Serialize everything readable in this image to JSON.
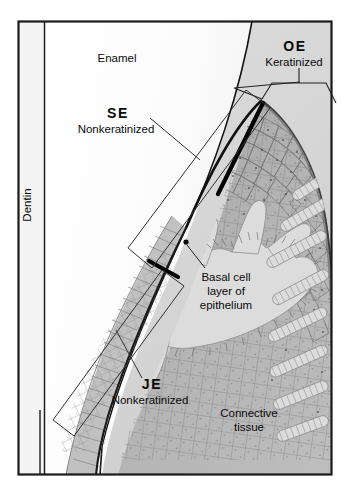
{
  "figure": {
    "name": "gingival-epithelium-histology-diagram",
    "frame": {
      "border_color": "#1a1a1a"
    },
    "colors": {
      "background": "#ffffff",
      "enamel": "#fdfdfd",
      "dentin": "#f2f2f2",
      "connective_tissue": "#d6d6d6",
      "epithelium": "#b2b2b2",
      "epithelium_dark": "#9a9a9a",
      "rete_peg": "#d8d8d8",
      "outline_dark": "#111111",
      "leader_line": "#2a2a2a",
      "marker_black": "#000000",
      "text": "#0a0a0a"
    }
  },
  "labels": {
    "dentin": "Dentin",
    "enamel": "Enamel",
    "oe_abbr": "OE",
    "oe_sub": "Keratinized",
    "se_abbr": "SE",
    "se_sub": "Nonkeratinized",
    "je_abbr": "JE",
    "je_sub": "Nonkeratinized",
    "basal_line1": "Basal cell",
    "basal_line2": "layer of",
    "basal_line3": "epithelium",
    "connective_line1": "Connective",
    "connective_line2": "tissue"
  },
  "regions": [
    {
      "id": "dentin",
      "label": "Dentin",
      "description": "vertical band at left of tooth"
    },
    {
      "id": "enamel",
      "label": "Enamel",
      "description": "white tooth region left of gingiva"
    },
    {
      "id": "oral-epithelium",
      "label": "OE",
      "sublabel": "Keratinized",
      "description": "outer gingival surface epithelium"
    },
    {
      "id": "sulcular-epithelium",
      "label": "SE",
      "sublabel": "Nonkeratinized",
      "description": "epithelium lining the gingival sulcus"
    },
    {
      "id": "junctional-epithelium",
      "label": "JE",
      "sublabel": "Nonkeratinized",
      "description": "epithelium attaching gingiva to tooth"
    },
    {
      "id": "basal-cell-layer",
      "label": "Basal cell layer of epithelium",
      "description": "deepest epithelial cell layer"
    },
    {
      "id": "connective-tissue",
      "label": "Connective tissue",
      "description": "lamina propria beneath epithelium"
    }
  ]
}
